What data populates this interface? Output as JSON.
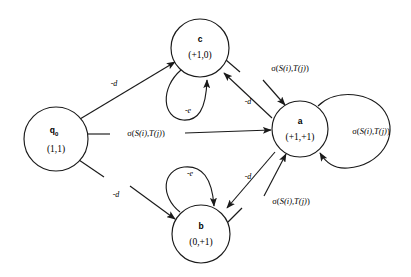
{
  "diagram": {
    "type": "state-transition-diagram",
    "title": "",
    "background_color": "#ffffff",
    "stroke_color": "#1a1a1a",
    "nodes": [
      {
        "id": "q0",
        "name": "q",
        "subscript": "0",
        "value": "(1,1)",
        "cx": 56,
        "cy": 139,
        "r": 32
      },
      {
        "id": "c",
        "name": "c",
        "subscript": "",
        "value": "(+1,0)",
        "cx": 200,
        "cy": 48,
        "r": 29
      },
      {
        "id": "a",
        "name": "a",
        "subscript": "",
        "value": "(+1,+1)",
        "cx": 300,
        "cy": 129,
        "r": 28
      },
      {
        "id": "b",
        "name": "b",
        "subscript": "",
        "value": "(0,+1)",
        "cx": 201,
        "cy": 234,
        "r": 29
      }
    ],
    "edges": [
      {
        "id": "q0-to-c",
        "from": "q0",
        "to": "c",
        "label": "-d",
        "label_x": 114,
        "label_y": 83,
        "label_style": "italic"
      },
      {
        "id": "q0-to-a",
        "from": "q0",
        "to": "a",
        "label": "sigma",
        "label_x": 146,
        "label_y": 136,
        "label_style": "sigma"
      },
      {
        "id": "q0-to-b",
        "from": "q0",
        "to": "b",
        "label": "-d",
        "label_x": 116,
        "label_y": 194,
        "label_style": "italic"
      },
      {
        "id": "c-to-a",
        "from": "c",
        "to": "a",
        "label": "sigma",
        "label_x": 290,
        "label_y": 68,
        "label_style": "sigma"
      },
      {
        "id": "a-to-c",
        "from": "a",
        "to": "c",
        "label": "-d",
        "label_x": 248,
        "label_y": 101,
        "label_style": "italic"
      },
      {
        "id": "b-to-a",
        "from": "b",
        "to": "a",
        "label": "sigma",
        "label_x": 291,
        "label_y": 201,
        "label_style": "sigma"
      },
      {
        "id": "a-to-b",
        "from": "a",
        "to": "b",
        "label": "-d",
        "label_x": 248,
        "label_y": 176,
        "label_style": "italic"
      }
    ],
    "self_loops": [
      {
        "id": "c-self-loop",
        "on": "c",
        "label": "-e",
        "label_x": 188,
        "label_y": 110,
        "label_style": "italic"
      },
      {
        "id": "b-self-loop",
        "on": "b",
        "label": "-e",
        "label_x": 190,
        "label_y": 173,
        "label_style": "italic"
      },
      {
        "id": "a-self-loop",
        "on": "a",
        "label": "sigma",
        "label_x": 371,
        "label_y": 131,
        "label_style": "sigma"
      }
    ],
    "sigma_text": {
      "prefix": "σ(",
      "s_fn": "S",
      "i_arg": "(i)",
      "comma": ",",
      "t_fn": "T",
      "j_arg": "(j)",
      "suffix": ")",
      "plain": "σ(S(i),T(j))"
    },
    "cost_labels": {
      "deletion": "-d",
      "extension": "-e"
    }
  }
}
